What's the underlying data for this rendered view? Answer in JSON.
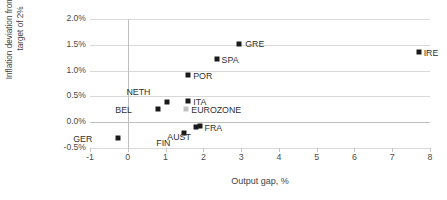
{
  "chart_data": {
    "type": "scatter",
    "title": "",
    "xlabel": "Output gap, %",
    "ylabel": "Inflation deviation from ECB\ntarget of 2%",
    "xlim": [
      -1,
      8
    ],
    "ylim": [
      -0.5,
      2.0
    ],
    "xticks": [
      "-1",
      "0",
      "1",
      "2",
      "3",
      "4",
      "5",
      "6",
      "7",
      "8"
    ],
    "xtick_values": [
      -1,
      0,
      1,
      2,
      3,
      4,
      5,
      6,
      7,
      8
    ],
    "yticks": [
      "-0.5%",
      "0.0%",
      "0.5%",
      "1.0%",
      "1.5%",
      "2.0%"
    ],
    "ytick_values": [
      -0.5,
      0.0,
      0.5,
      1.0,
      1.5,
      2.0
    ],
    "grid": "horizontal",
    "legend": "none",
    "marker_color": "#1a1a1a",
    "highlight_color": "#c2c2c2",
    "points": [
      {
        "label": "GER",
        "x": -0.25,
        "y": -0.3,
        "lx": -26,
        "ly": -4,
        "color": "dark"
      },
      {
        "label": "BEL",
        "x": 0.8,
        "y": 0.25,
        "lx": -26,
        "ly": -4,
        "color": "dark"
      },
      {
        "label": "NETH",
        "x": 1.05,
        "y": 0.4,
        "lx": -17,
        "ly": -15,
        "color": "dark"
      },
      {
        "label": "EUROZONE",
        "x": 1.55,
        "y": 0.25,
        "lx": 5,
        "ly": -4,
        "color": "light"
      },
      {
        "label": "ITA",
        "x": 1.6,
        "y": 0.42,
        "lx": 5,
        "ly": -4,
        "color": "dark"
      },
      {
        "label": "FIN",
        "x": 1.5,
        "y": -0.2,
        "lx": -14,
        "ly": 5,
        "color": "dark"
      },
      {
        "label": "AUST",
        "x": 1.8,
        "y": -0.1,
        "lx": -5,
        "ly": 5,
        "color": "dark"
      },
      {
        "label": "FRA",
        "x": 1.9,
        "y": -0.07,
        "lx": 5,
        "ly": -3,
        "color": "dark"
      },
      {
        "label": "POR",
        "x": 1.6,
        "y": 0.91,
        "lx": 5,
        "ly": -4,
        "color": "dark"
      },
      {
        "label": "SPA",
        "x": 2.35,
        "y": 1.22,
        "lx": 5,
        "ly": -4,
        "color": "dark"
      },
      {
        "label": "GRE",
        "x": 2.95,
        "y": 1.52,
        "lx": 6,
        "ly": -5,
        "color": "dark"
      },
      {
        "label": "IRE",
        "x": 7.7,
        "y": 1.37,
        "lx": 5,
        "ly": -4,
        "color": "dark"
      }
    ]
  }
}
